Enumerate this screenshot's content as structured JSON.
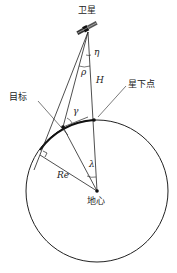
{
  "labels": {
    "satellite": "卫星",
    "sub_satellite_point": "星下点",
    "target": "目标",
    "earth_center": "地心"
  },
  "symbols": {
    "eta": "η",
    "rho": "ρ",
    "H": "H",
    "gamma": "γ",
    "lambda": "λ",
    "Re": "Re"
  },
  "colors": {
    "line": "#222222",
    "background": "#ffffff"
  }
}
